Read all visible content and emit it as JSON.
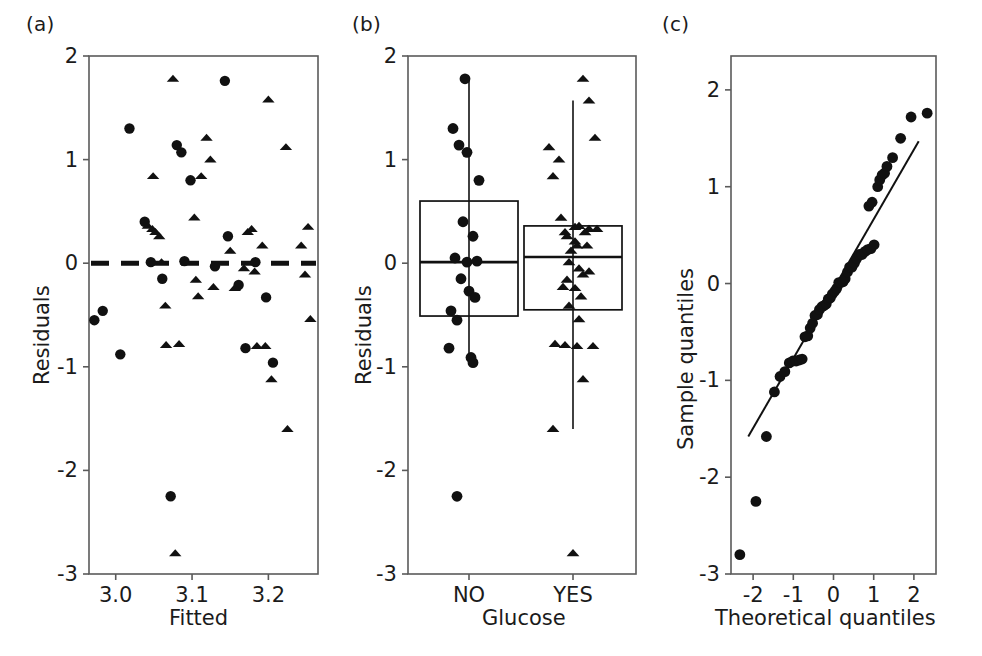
{
  "figure": {
    "background": "#ffffff",
    "ink": "#111111",
    "panels": [
      "(a)",
      "(b)",
      "(c)"
    ]
  },
  "chart_data": [
    {
      "id": "panel-a",
      "panel_label": "(a)",
      "type": "scatter",
      "title": "",
      "xlabel": "Fitted",
      "ylabel": "Residuals",
      "xlim": [
        2.965,
        3.265
      ],
      "ylim": [
        -3,
        2
      ],
      "xticks": [
        3.0,
        3.1,
        3.2
      ],
      "xtick_labels": [
        "3.0",
        "3.1",
        "3.2"
      ],
      "yticks": [
        2,
        1,
        0,
        -1,
        -2,
        -3
      ],
      "ytick_labels": [
        "2",
        "1",
        "0",
        "-1",
        "-2",
        "-3"
      ],
      "grid": false,
      "legend": "none",
      "reference_line": {
        "style": "dashed",
        "orientation": "horizontal",
        "y": 0,
        "dash_pattern": "18 12",
        "width": 5
      },
      "series": [
        {
          "name": "Glucose NO",
          "marker": "circle",
          "color": "#111111",
          "points": [
            [
              2.972,
              -0.55
            ],
            [
              2.983,
              -0.46
            ],
            [
              3.006,
              -0.88
            ],
            [
              3.018,
              1.3
            ],
            [
              3.038,
              0.4
            ],
            [
              3.046,
              0.01
            ],
            [
              3.061,
              -0.15
            ],
            [
              3.072,
              -2.25
            ],
            [
              3.08,
              1.14
            ],
            [
              3.086,
              1.07
            ],
            [
              3.09,
              0.02
            ],
            [
              3.098,
              0.8
            ],
            [
              3.143,
              1.76
            ],
            [
              3.147,
              0.26
            ],
            [
              3.161,
              -0.21
            ],
            [
              3.183,
              0.01
            ],
            [
              3.197,
              -0.33
            ],
            [
              3.206,
              -0.96
            ],
            [
              3.13,
              -0.03
            ],
            [
              3.17,
              -0.82
            ]
          ]
        },
        {
          "name": "Glucose YES",
          "marker": "triangle",
          "color": "#111111",
          "points": [
            [
              3.042,
              0.36
            ],
            [
              3.048,
              0.33
            ],
            [
              3.052,
              0.3
            ],
            [
              3.057,
              0.26
            ],
            [
              3.06,
              0.01
            ],
            [
              3.065,
              -0.41
            ],
            [
              3.066,
              -0.79
            ],
            [
              3.075,
              1.78
            ],
            [
              3.078,
              -2.8
            ],
            [
              3.083,
              -0.78
            ],
            [
              3.092,
              0.01
            ],
            [
              3.103,
              0.44
            ],
            [
              3.105,
              -0.16
            ],
            [
              3.108,
              -0.32
            ],
            [
              3.112,
              0.84
            ],
            [
              3.119,
              1.21
            ],
            [
              3.124,
              1.0
            ],
            [
              3.128,
              -0.23
            ],
            [
              3.15,
              0.12
            ],
            [
              3.156,
              -0.24
            ],
            [
              3.168,
              -0.05
            ],
            [
              3.173,
              0.3
            ],
            [
              3.178,
              0.33
            ],
            [
              3.182,
              -0.08
            ],
            [
              3.185,
              -0.8
            ],
            [
              3.192,
              0.17
            ],
            [
              3.196,
              -0.8
            ],
            [
              3.2,
              1.58
            ],
            [
              3.204,
              -1.12
            ],
            [
              3.223,
              1.12
            ],
            [
              3.225,
              -1.6
            ],
            [
              3.243,
              0.17
            ],
            [
              3.248,
              -0.11
            ],
            [
              3.252,
              0.35
            ],
            [
              3.255,
              -0.54
            ],
            [
              3.049,
              0.84
            ]
          ]
        }
      ]
    },
    {
      "id": "panel-b",
      "panel_label": "(b)",
      "type": "boxplot",
      "title": "",
      "xlabel": "Glucose",
      "ylabel": "Residuals",
      "ylim": [
        -3,
        2
      ],
      "yticks": [
        2,
        1,
        0,
        -1,
        -2,
        -3
      ],
      "ytick_labels": [
        "2",
        "1",
        "0",
        "-1",
        "-2",
        "-3"
      ],
      "categories": [
        "NO",
        "YES"
      ],
      "grid": false,
      "legend": "none",
      "boxes": [
        {
          "category": "NO",
          "q1": -0.51,
          "median": 0.01,
          "q3": 0.6,
          "whisker_low": -0.96,
          "whisker_high": 1.78,
          "outliers": [
            -2.25
          ],
          "marker": "circle",
          "points": [
            1.78,
            1.3,
            1.14,
            1.07,
            0.8,
            0.4,
            0.26,
            0.05,
            0.01,
            0.02,
            -0.15,
            -0.27,
            -0.33,
            -0.46,
            -0.55,
            -0.82,
            -0.91,
            -0.96,
            -2.25
          ]
        },
        {
          "category": "YES",
          "q1": -0.45,
          "median": 0.06,
          "q3": 0.36,
          "whisker_low": -1.6,
          "whisker_high": 1.57,
          "outliers": [
            1.78,
            -2.8
          ],
          "marker": "triangle",
          "points": [
            1.78,
            1.57,
            1.21,
            1.12,
            1.0,
            0.84,
            0.44,
            0.36,
            0.35,
            0.33,
            0.33,
            0.3,
            0.3,
            0.26,
            0.21,
            0.17,
            0.17,
            0.12,
            0.01,
            -0.05,
            -0.08,
            -0.11,
            -0.16,
            -0.23,
            -0.24,
            -0.32,
            -0.41,
            -0.54,
            -0.78,
            -0.79,
            -0.8,
            -0.8,
            -1.12,
            -1.6,
            -2.8
          ]
        }
      ]
    },
    {
      "id": "panel-c",
      "panel_label": "(c)",
      "type": "scatter",
      "title": "",
      "xlabel": "Theoretical quantiles",
      "ylabel": "Sample quantiles",
      "xlim": [
        -2.55,
        2.55
      ],
      "ylim": [
        -3,
        2.35
      ],
      "xticks": [
        -2,
        -1,
        0,
        1,
        2
      ],
      "xtick_labels": [
        "-2",
        "-1",
        "0",
        "1",
        "2"
      ],
      "yticks": [
        2,
        1,
        0,
        -1,
        -2,
        -3
      ],
      "ytick_labels": [
        "2",
        "1",
        "0",
        "-1",
        "-2",
        "-3"
      ],
      "grid": false,
      "legend": "none",
      "reference_line": {
        "style": "solid",
        "x0": -2.12,
        "y0": -1.58,
        "x1": 2.12,
        "y1": 1.47,
        "width": 2
      },
      "series": [
        {
          "name": "Sample quantiles",
          "marker": "circle",
          "color": "#111111",
          "points": [
            [
              -2.33,
              -2.8
            ],
            [
              -1.93,
              -2.25
            ],
            [
              -1.67,
              -1.58
            ],
            [
              -1.47,
              -1.12
            ],
            [
              -1.33,
              -0.96
            ],
            [
              -1.21,
              -0.91
            ],
            [
              -1.1,
              -0.82
            ],
            [
              -1.01,
              -0.8
            ],
            [
              -0.93,
              -0.8
            ],
            [
              -0.85,
              -0.79
            ],
            [
              -0.78,
              -0.78
            ],
            [
              -0.71,
              -0.55
            ],
            [
              -0.64,
              -0.54
            ],
            [
              -0.58,
              -0.46
            ],
            [
              -0.52,
              -0.41
            ],
            [
              -0.46,
              -0.33
            ],
            [
              -0.4,
              -0.32
            ],
            [
              -0.35,
              -0.27
            ],
            [
              -0.29,
              -0.24
            ],
            [
              -0.24,
              -0.23
            ],
            [
              -0.18,
              -0.21
            ],
            [
              -0.13,
              -0.16
            ],
            [
              -0.08,
              -0.15
            ],
            [
              -0.03,
              -0.11
            ],
            [
              0.03,
              -0.08
            ],
            [
              0.08,
              -0.05
            ],
            [
              0.13,
              0.01
            ],
            [
              0.18,
              0.01
            ],
            [
              0.24,
              0.02
            ],
            [
              0.29,
              0.05
            ],
            [
              0.35,
              0.12
            ],
            [
              0.4,
              0.17
            ],
            [
              0.46,
              0.17
            ],
            [
              0.52,
              0.21
            ],
            [
              0.58,
              0.26
            ],
            [
              0.64,
              0.3
            ],
            [
              0.71,
              0.3
            ],
            [
              0.78,
              0.33
            ],
            [
              0.85,
              0.35
            ],
            [
              0.93,
              0.36
            ],
            [
              1.01,
              0.4
            ],
            [
              0.88,
              0.8
            ],
            [
              0.96,
              0.84
            ],
            [
              1.1,
              1.0
            ],
            [
              1.15,
              1.07
            ],
            [
              1.21,
              1.12
            ],
            [
              1.27,
              1.14
            ],
            [
              1.33,
              1.21
            ],
            [
              1.47,
              1.3
            ],
            [
              1.67,
              1.5
            ],
            [
              1.93,
              1.72
            ],
            [
              2.33,
              1.76
            ]
          ]
        }
      ]
    }
  ]
}
